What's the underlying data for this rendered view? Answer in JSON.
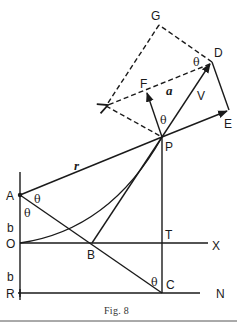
{
  "figure": {
    "caption": "Fig. 8",
    "points": {
      "G": "G",
      "D": "D",
      "F": "F",
      "E": "E",
      "P": "P",
      "A": "A",
      "O": "O",
      "R": "R",
      "B": "B",
      "T": "T",
      "C": "C",
      "X": "X",
      "N": "N"
    },
    "symbols": {
      "theta_D": "θ",
      "theta_P": "θ",
      "theta_A1": "θ",
      "theta_A2": "θ",
      "theta_C": "θ",
      "a": "a",
      "V": "V",
      "r": "r",
      "b_upper": "b",
      "b_lower": "b"
    },
    "colors": {
      "ink": "#1a1a1a",
      "paper": "#ffffff"
    }
  }
}
